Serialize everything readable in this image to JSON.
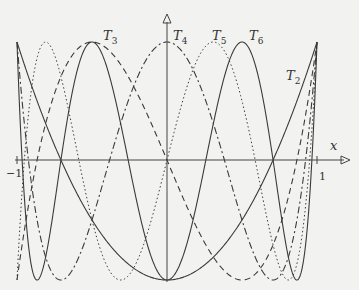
{
  "chart_data": {
    "type": "line",
    "title": "",
    "xlabel": "x",
    "ylabel": "",
    "xlim": [
      -1,
      1
    ],
    "ylim": [
      -1,
      1
    ],
    "grid": false,
    "legend": "inline labels",
    "x_ticks": [
      "-1",
      "1"
    ],
    "series": [
      {
        "name": "T2",
        "label_main": "T",
        "label_sub": "2",
        "order": 2,
        "style": "solid"
      },
      {
        "name": "T3",
        "label_main": "T",
        "label_sub": "3",
        "order": 3,
        "style": "dashed"
      },
      {
        "name": "T4",
        "label_main": "T",
        "label_sub": "4",
        "order": 4,
        "style": "dashdot"
      },
      {
        "name": "T5",
        "label_main": "T",
        "label_sub": "5",
        "order": 5,
        "style": "dotted"
      },
      {
        "name": "T6",
        "label_main": "T",
        "label_sub": "6",
        "order": 6,
        "style": "solid"
      }
    ],
    "formula": "T_n(x) = cos(n * arccos(x))"
  },
  "labels": {
    "x_axis": "x",
    "tick_neg1": "−1",
    "tick_pos1": "1",
    "T2": {
      "main": "T",
      "sub": "2"
    },
    "T3": {
      "main": "T",
      "sub": "3"
    },
    "T4": {
      "main": "T",
      "sub": "4"
    },
    "T5": {
      "main": "T",
      "sub": "5"
    },
    "T6": {
      "main": "T",
      "sub": "6"
    }
  },
  "colors": {
    "line": "#3a3a3a",
    "background": "#f2f2f0"
  }
}
